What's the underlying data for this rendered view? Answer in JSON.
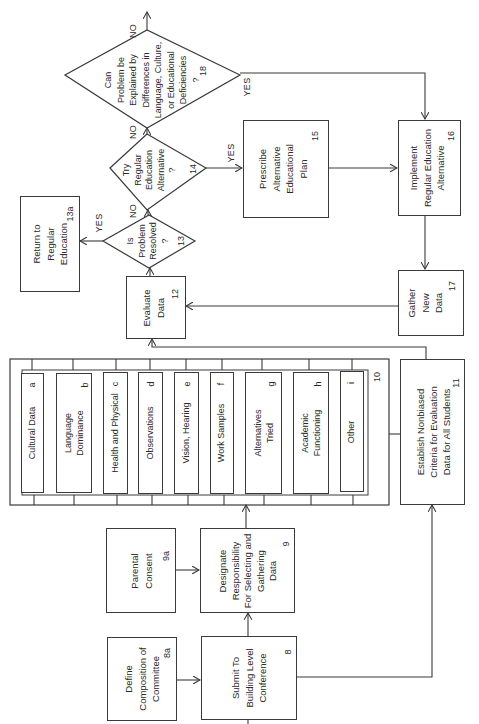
{
  "diagram": {
    "orientation": "rotated-90-ccw",
    "nodes": {
      "n8a": {
        "id": "8a",
        "text": "Define\nComposition of\nCommittee"
      },
      "n8": {
        "id": "8",
        "text": "Submit To\nBuilding Level\nConference"
      },
      "n9a": {
        "id": "9a",
        "text": "Parental\nConsent"
      },
      "n9": {
        "id": "9",
        "text": "Designate\nResponsibility\nFor Selecting and\nGathering\nData"
      },
      "n10": {
        "id": "10",
        "text": ""
      },
      "n11": {
        "id": "11",
        "text": "Establish Nonbiased\nCriteria for Evaluation\nData for All Students"
      },
      "n12": {
        "id": "12",
        "text": "Evaluate\nData"
      },
      "n13": {
        "id": "13",
        "text": "Is\nProblem\nResolved\n?"
      },
      "n13a": {
        "id": "13a",
        "text": "Return to\nRegular\nEducation"
      },
      "n14": {
        "id": "14",
        "text": "Try\nRegular\nEducation\nAlternative\n?"
      },
      "n15": {
        "id": "15",
        "text": "Prescribe\nAlternative\nEducational\nPlan"
      },
      "n16": {
        "id": "16",
        "text": "Implement\nRegular Education\nAlternative"
      },
      "n17": {
        "id": "17",
        "text": "Gather\nNew\nData"
      },
      "n18": {
        "id": "18",
        "text": "Can\nProblem be\nExplained by\nDifferences in\nLanguage, Culture,\nor Educational\nDeficiencies\n?"
      }
    },
    "data_items": [
      {
        "id": "a",
        "text": "Cultural Data"
      },
      {
        "id": "b",
        "text": "Language\nDominance"
      },
      {
        "id": "c",
        "text": "Health and Physical"
      },
      {
        "id": "d",
        "text": "Observations"
      },
      {
        "id": "e",
        "text": "Vision, Hearing"
      },
      {
        "id": "f",
        "text": "Work Samples"
      },
      {
        "id": "g",
        "text": "Alternatives\nTried"
      },
      {
        "id": "h",
        "text": "Academic\nFunctioning"
      },
      {
        "id": "i",
        "text": "Other"
      }
    ],
    "edge_labels": {
      "yes_13": "YES",
      "no_13": "NO",
      "yes_14": "YES",
      "no_14": "NO",
      "yes_18": "YES",
      "no_18": "NO"
    },
    "edges": [
      {
        "from": "8a",
        "to": "8"
      },
      {
        "from": "9a",
        "to": "9"
      },
      {
        "from": "8",
        "to": "9"
      },
      {
        "from": "8",
        "to": "11"
      },
      {
        "from": "9",
        "to": "10"
      },
      {
        "from": "10",
        "to": "12"
      },
      {
        "from": "11",
        "to": "10"
      },
      {
        "from": "12",
        "to": "13"
      },
      {
        "from": "13",
        "to": "13a",
        "label": "YES"
      },
      {
        "from": "13",
        "to": "14",
        "label": "NO"
      },
      {
        "from": "14",
        "to": "15",
        "label": "YES"
      },
      {
        "from": "14",
        "to": "18",
        "label": "NO"
      },
      {
        "from": "18",
        "to": "16",
        "label": "YES"
      },
      {
        "from": "18",
        "to": "off-page",
        "label": "NO"
      },
      {
        "from": "15",
        "to": "16"
      },
      {
        "from": "16",
        "to": "17"
      },
      {
        "from": "17",
        "to": "12"
      }
    ],
    "colors": {
      "line": "#3a3a3a",
      "text": "#2a2a2a",
      "background": "#ffffff"
    }
  }
}
